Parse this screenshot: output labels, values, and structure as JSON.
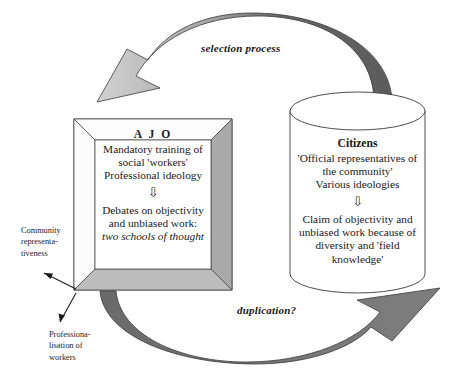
{
  "diagram": {
    "left_box": {
      "heading": "A J O",
      "lines_top": [
        "Mandatory training of",
        "social 'workers'",
        "Professional ideology"
      ],
      "arrow_glyph": "⇩",
      "lines_bottom": [
        "Debates on objectivity",
        "and unbiased work:"
      ],
      "emphasis_line": "two schools of thought"
    },
    "right_cylinder": {
      "heading": "Citizens",
      "lines_top": [
        "'Official representatives of",
        "the community'",
        "Various ideologies"
      ],
      "arrow_glyph": "⇩",
      "lines_bottom": [
        "Claim of objectivity and",
        "unbiased work because of",
        "diversity and 'field",
        "knowledge'"
      ]
    },
    "arrows": {
      "top_label": "selection process",
      "bottom_label": "duplication?"
    },
    "side_notes": {
      "upper": "Community\nrepresenta-\ntiveness",
      "lower": "Professiona-\nlisation of\nworkers"
    },
    "colors": {
      "arrow_dark": "#5f5f5f",
      "arrow_light": "#c9c9c9",
      "bevel_gray": "#a9a9a9",
      "bevel_light": "#fdfdfd",
      "outline": "#3a3a3a",
      "background": "#ffffff"
    }
  }
}
